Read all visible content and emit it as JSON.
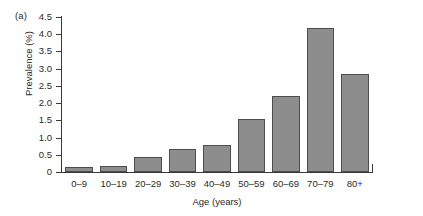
{
  "panel": {
    "label": "(a)"
  },
  "chart_data": {
    "type": "bar",
    "title": "",
    "subtitle": "",
    "xlabel": "Age (years)",
    "ylabel": "Prevalence (%)",
    "categories": [
      "0–9",
      "10–19",
      "20–29",
      "30–39",
      "40–49",
      "50–59",
      "60–69",
      "70–79",
      "80+"
    ],
    "values": [
      0.14,
      0.17,
      0.44,
      0.67,
      0.78,
      1.55,
      2.2,
      4.18,
      2.85
    ],
    "ylim": [
      0,
      4.5
    ],
    "yticks": [
      0,
      0.5,
      1.0,
      1.5,
      2.0,
      2.5,
      3.0,
      3.5,
      4.0,
      4.5
    ],
    "ytick_labels": [
      "0",
      "0.5",
      "1.0",
      "1.5",
      "2.0",
      "2.5",
      "3.0",
      "3.5",
      "4.0",
      "4.5"
    ],
    "grid": false,
    "legend": null,
    "bar_color": "#8d8d8d",
    "bar_edge_color": "#4d4d4d",
    "axis_color": "#3a3a3a",
    "background": "#ffffff"
  }
}
